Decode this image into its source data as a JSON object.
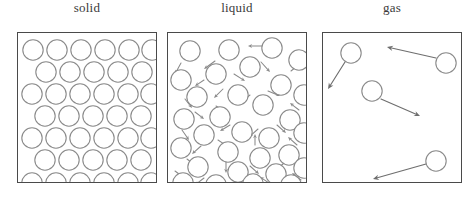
{
  "figure": {
    "width": 474,
    "height": 197,
    "background_color": "#ffffff"
  },
  "style": {
    "particle_stroke": "#8a8a8a",
    "particle_fill": "#ffffff",
    "box_border": "#4a4a4a",
    "arrow_color": "#8a8a8a",
    "gas_arrow_color": "#6e6e6e",
    "label_color": "#3a3a3a",
    "particle_radius": 10.2
  },
  "panels": [
    {
      "id": "solid",
      "label": "solid",
      "box": {
        "x": 17,
        "y": 32,
        "width": 140,
        "height": 151
      },
      "description": "closely packed regular lattice of particles, no motion arrows",
      "arrangement": "ordered-staggered-rows",
      "row_counts": [
        6,
        5,
        6,
        5,
        6,
        5,
        6
      ],
      "particle_count": 39,
      "particles": [
        {
          "cx": 15,
          "cy": 17
        },
        {
          "cx": 39,
          "cy": 17
        },
        {
          "cx": 63,
          "cy": 17
        },
        {
          "cx": 87,
          "cy": 17
        },
        {
          "cx": 111,
          "cy": 17
        },
        {
          "cx": 134,
          "cy": 17
        },
        {
          "cx": 28,
          "cy": 39
        },
        {
          "cx": 52,
          "cy": 39
        },
        {
          "cx": 76,
          "cy": 39
        },
        {
          "cx": 100,
          "cy": 39
        },
        {
          "cx": 124,
          "cy": 39
        },
        {
          "cx": 14,
          "cy": 61
        },
        {
          "cx": 38,
          "cy": 61
        },
        {
          "cx": 62,
          "cy": 61
        },
        {
          "cx": 86,
          "cy": 61
        },
        {
          "cx": 110,
          "cy": 61
        },
        {
          "cx": 133,
          "cy": 61
        },
        {
          "cx": 27,
          "cy": 83
        },
        {
          "cx": 51,
          "cy": 83
        },
        {
          "cx": 75,
          "cy": 83
        },
        {
          "cx": 99,
          "cy": 83
        },
        {
          "cx": 123,
          "cy": 83
        },
        {
          "cx": 14,
          "cy": 105
        },
        {
          "cx": 38,
          "cy": 105
        },
        {
          "cx": 62,
          "cy": 105
        },
        {
          "cx": 86,
          "cy": 105
        },
        {
          "cx": 110,
          "cy": 105
        },
        {
          "cx": 133,
          "cy": 105
        },
        {
          "cx": 27,
          "cy": 127
        },
        {
          "cx": 51,
          "cy": 127
        },
        {
          "cx": 75,
          "cy": 127
        },
        {
          "cx": 99,
          "cy": 127
        },
        {
          "cx": 123,
          "cy": 127
        },
        {
          "cx": 14,
          "cy": 150
        },
        {
          "cx": 38,
          "cy": 150
        },
        {
          "cx": 62,
          "cy": 150
        },
        {
          "cx": 86,
          "cy": 150
        },
        {
          "cx": 110,
          "cy": 150
        },
        {
          "cx": 133,
          "cy": 150
        }
      ],
      "arrows": []
    },
    {
      "id": "liquid",
      "label": "liquid",
      "box": {
        "x": 167,
        "y": 32,
        "width": 140,
        "height": 151
      },
      "description": "particles close together but randomly arranged, short arrows showing motion in all directions",
      "arrangement": "disordered-close-packed",
      "particle_count": 31,
      "particles": [
        {
          "cx": 22,
          "cy": 18
        },
        {
          "cx": 61,
          "cy": 17
        },
        {
          "cx": 104,
          "cy": 15
        },
        {
          "cx": 131,
          "cy": 27
        },
        {
          "cx": 82,
          "cy": 34
        },
        {
          "cx": 13,
          "cy": 47
        },
        {
          "cx": 48,
          "cy": 41
        },
        {
          "cx": 113,
          "cy": 52
        },
        {
          "cx": 29,
          "cy": 64
        },
        {
          "cx": 70,
          "cy": 62
        },
        {
          "cx": 95,
          "cy": 72
        },
        {
          "cx": 136,
          "cy": 62
        },
        {
          "cx": 16,
          "cy": 86
        },
        {
          "cx": 52,
          "cy": 84
        },
        {
          "cx": 122,
          "cy": 87
        },
        {
          "cx": 36,
          "cy": 102
        },
        {
          "cx": 74,
          "cy": 99
        },
        {
          "cx": 101,
          "cy": 105
        },
        {
          "cx": 136,
          "cy": 100
        },
        {
          "cx": 13,
          "cy": 115
        },
        {
          "cx": 60,
          "cy": 119
        },
        {
          "cx": 92,
          "cy": 125
        },
        {
          "cx": 121,
          "cy": 122
        },
        {
          "cx": 30,
          "cy": 134
        },
        {
          "cx": 70,
          "cy": 139
        },
        {
          "cx": 108,
          "cy": 141
        },
        {
          "cx": 136,
          "cy": 135
        },
        {
          "cx": 15,
          "cy": 150
        },
        {
          "cx": 48,
          "cy": 152
        },
        {
          "cx": 85,
          "cy": 151
        },
        {
          "cx": 123,
          "cy": 152
        }
      ],
      "arrows": [
        {
          "x1": 95,
          "y1": 13,
          "x2": 80,
          "y2": 13
        },
        {
          "x1": 47,
          "y1": 28,
          "x2": 36,
          "y2": 36
        },
        {
          "x1": 13,
          "y1": 30,
          "x2": 7,
          "y2": 41
        },
        {
          "x1": 93,
          "y1": 29,
          "x2": 102,
          "y2": 39
        },
        {
          "x1": 123,
          "y1": 38,
          "x2": 133,
          "y2": 30
        },
        {
          "x1": 36,
          "y1": 47,
          "x2": 27,
          "y2": 53
        },
        {
          "x1": 66,
          "y1": 41,
          "x2": 77,
          "y2": 48
        },
        {
          "x1": 100,
          "y1": 58,
          "x2": 112,
          "y2": 63
        },
        {
          "x1": 17,
          "y1": 66,
          "x2": 24,
          "y2": 75
        },
        {
          "x1": 55,
          "y1": 56,
          "x2": 46,
          "y2": 65
        },
        {
          "x1": 82,
          "y1": 62,
          "x2": 72,
          "y2": 70
        },
        {
          "x1": 131,
          "y1": 77,
          "x2": 122,
          "y2": 70
        },
        {
          "x1": 27,
          "y1": 79,
          "x2": 36,
          "y2": 86
        },
        {
          "x1": 48,
          "y1": 73,
          "x2": 58,
          "y2": 79
        },
        {
          "x1": 109,
          "y1": 92,
          "x2": 118,
          "y2": 100
        },
        {
          "x1": 14,
          "y1": 97,
          "x2": 21,
          "y2": 107
        },
        {
          "x1": 62,
          "y1": 92,
          "x2": 52,
          "y2": 98
        },
        {
          "x1": 90,
          "y1": 96,
          "x2": 81,
          "y2": 104
        },
        {
          "x1": 129,
          "y1": 112,
          "x2": 120,
          "y2": 104
        },
        {
          "x1": 33,
          "y1": 113,
          "x2": 24,
          "y2": 121
        },
        {
          "x1": 50,
          "y1": 107,
          "x2": 59,
          "y2": 113
        },
        {
          "x1": 87,
          "y1": 112,
          "x2": 87,
          "y2": 101
        },
        {
          "x1": 115,
          "y1": 131,
          "x2": 106,
          "y2": 138
        },
        {
          "x1": 19,
          "y1": 126,
          "x2": 28,
          "y2": 133
        },
        {
          "x1": 58,
          "y1": 128,
          "x2": 58,
          "y2": 140
        },
        {
          "x1": 82,
          "y1": 133,
          "x2": 91,
          "y2": 141
        },
        {
          "x1": 133,
          "y1": 147,
          "x2": 124,
          "y2": 140
        },
        {
          "x1": 36,
          "y1": 145,
          "x2": 27,
          "y2": 152
        },
        {
          "x1": 66,
          "y1": 147,
          "x2": 74,
          "y2": 154
        },
        {
          "x1": 101,
          "y1": 150,
          "x2": 92,
          "y2": 144
        },
        {
          "x1": 7,
          "y1": 138,
          "x2": 15,
          "y2": 144
        }
      ]
    },
    {
      "id": "gas",
      "label": "gas",
      "box": {
        "x": 322,
        "y": 32,
        "width": 140,
        "height": 151
      },
      "description": "few widely separated particles with long arrows showing fast free motion",
      "arrangement": "sparse-random",
      "particle_count": 4,
      "particles": [
        {
          "cx": 28,
          "cy": 20
        },
        {
          "cx": 123,
          "cy": 30
        },
        {
          "cx": 49,
          "cy": 58
        },
        {
          "cx": 113,
          "cy": 128
        }
      ],
      "arrows": [
        {
          "x1": 22,
          "y1": 29,
          "x2": 5,
          "y2": 56
        },
        {
          "x1": 113,
          "y1": 25,
          "x2": 64,
          "y2": 14
        },
        {
          "x1": 58,
          "y1": 66,
          "x2": 97,
          "y2": 83
        },
        {
          "x1": 103,
          "y1": 131,
          "x2": 50,
          "y2": 146
        }
      ]
    }
  ]
}
